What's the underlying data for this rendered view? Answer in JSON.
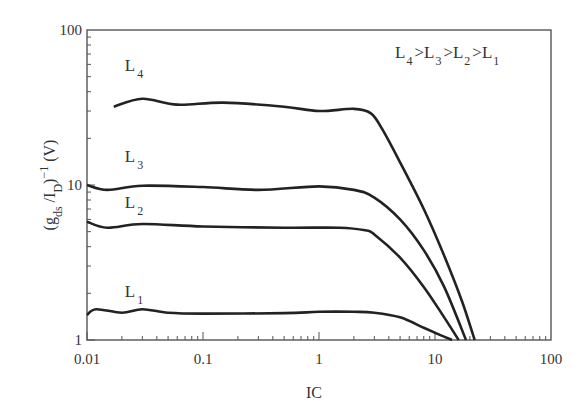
{
  "chart_data": {
    "type": "line",
    "title": "",
    "xlabel": "IC",
    "ylabel": "(g_ds / I_D)^-1 (V)",
    "xscale": "log",
    "yscale": "log",
    "xlim": [
      0.01,
      100
    ],
    "ylim": [
      1,
      100
    ],
    "x_ticks": [
      "0.01",
      "0.1",
      "1",
      "10",
      "100"
    ],
    "y_ticks": [
      "1",
      "10",
      "100"
    ],
    "grid": false,
    "annotation": "L4 > L3 > L2 > L1",
    "series": [
      {
        "name": "L4",
        "x": [
          0.017,
          0.03,
          0.06,
          0.15,
          0.5,
          1.0,
          2.0,
          2.8,
          3.5,
          5,
          8,
          12,
          17,
          22
        ],
        "y": [
          32,
          36,
          33,
          34,
          32,
          30,
          31,
          29,
          23,
          14,
          7,
          3.5,
          1.8,
          1.0
        ]
      },
      {
        "name": "L3",
        "x": [
          0.01,
          0.015,
          0.03,
          0.1,
          0.3,
          1.0,
          2.0,
          3.0,
          5,
          8,
          12,
          18.5
        ],
        "y": [
          10,
          9.3,
          9.9,
          9.7,
          9.3,
          9.8,
          9.3,
          8.3,
          6.0,
          3.8,
          2.2,
          1.0
        ]
      },
      {
        "name": "L2",
        "x": [
          0.01,
          0.015,
          0.03,
          0.1,
          0.5,
          1.5,
          2.5,
          3.0,
          5,
          8,
          12,
          16
        ],
        "y": [
          5.8,
          5.3,
          5.6,
          5.4,
          5.3,
          5.3,
          5.1,
          4.8,
          3.4,
          2.2,
          1.4,
          1.0
        ]
      },
      {
        "name": "L1",
        "x": [
          0.01,
          0.012,
          0.02,
          0.03,
          0.05,
          0.1,
          0.5,
          1.0,
          2.0,
          3.0,
          5,
          8,
          11,
          14
        ],
        "y": [
          1.45,
          1.58,
          1.5,
          1.58,
          1.5,
          1.48,
          1.49,
          1.52,
          1.52,
          1.5,
          1.4,
          1.2,
          1.08,
          1.0
        ]
      }
    ],
    "curve_labels": [
      {
        "name": "L4",
        "at": [
          0.028,
          58
        ]
      },
      {
        "name": "L3",
        "at": [
          0.028,
          15
        ]
      },
      {
        "name": "L2",
        "at": [
          0.028,
          7.5
        ]
      },
      {
        "name": "L1",
        "at": [
          0.028,
          2.0
        ]
      }
    ]
  }
}
